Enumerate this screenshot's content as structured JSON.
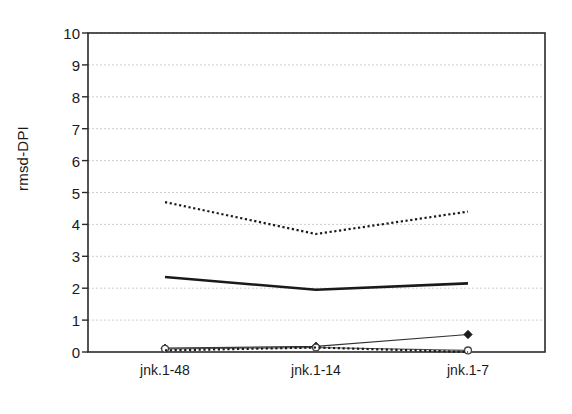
{
  "chart_data": {
    "type": "line",
    "title": "",
    "xlabel": "",
    "ylabel": "rmsd-DPI",
    "categories": [
      "jnk.1-48",
      "jnk.1-14",
      "jnk.1-7"
    ],
    "ylim": [
      0,
      10
    ],
    "yticks": [
      0,
      1,
      2,
      3,
      4,
      5,
      6,
      7,
      8,
      9,
      10
    ],
    "ytick_labels": [
      "0",
      "1",
      "2",
      "3",
      "4",
      "5",
      "6",
      "7",
      "8",
      "9",
      "10"
    ],
    "grid": true,
    "grid_axis": "y",
    "legend": "none",
    "series": [
      {
        "name": "dotted-upper",
        "style": "dotted",
        "color": "#1a1a1a",
        "marker": "none",
        "values": [
          4.7,
          3.7,
          4.4
        ]
      },
      {
        "name": "solid-thick",
        "style": "solid",
        "color": "#1a1a1a",
        "marker": "none",
        "values": [
          2.35,
          1.95,
          2.15
        ]
      },
      {
        "name": "diamond-line",
        "style": "solid",
        "color": "#333333",
        "marker": "filled-diamond",
        "values": [
          0.12,
          0.18,
          0.55
        ]
      },
      {
        "name": "circle-line",
        "style": "solid",
        "color": "#555555",
        "marker": "open-circle",
        "values": [
          0.1,
          0.14,
          0.05
        ]
      },
      {
        "name": "dotted-lower",
        "style": "dotted",
        "color": "#1a1a1a",
        "marker": "none",
        "values": [
          0.05,
          0.14,
          0.0
        ]
      }
    ]
  },
  "axis": {
    "y_label": "rmsd-DPI"
  }
}
